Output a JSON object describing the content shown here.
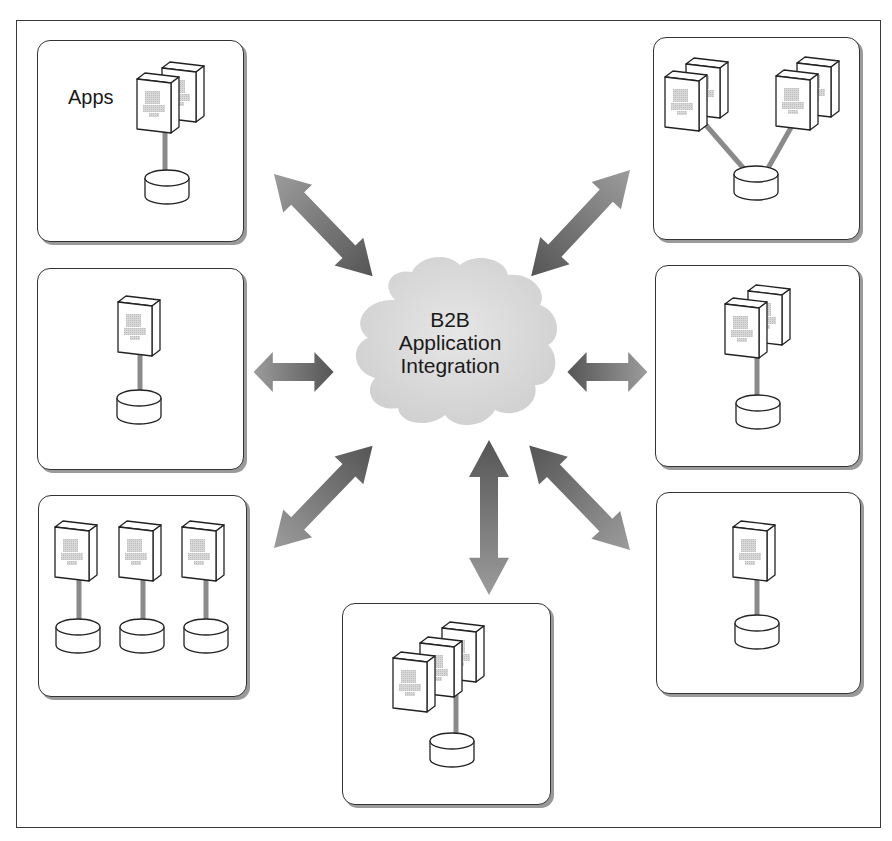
{
  "diagram": {
    "title": "B2B Application Integration",
    "hub": {
      "label_lines": [
        "B2B",
        "Application",
        "Integration"
      ],
      "shape": "cloud",
      "fill": "#d9d9d9"
    },
    "apps_label": "Apps",
    "colors": {
      "box_border": "#333333",
      "box_shadow": "#9a9a9a",
      "arrow_dark": "#555555",
      "arrow_light": "#9a9a9a",
      "connector": "#8a8a8a",
      "cloud_fill": "#d9d9d9"
    },
    "nodes": [
      {
        "id": "top-left",
        "label": "Apps",
        "servers": 2,
        "databases": 1,
        "layout": "stacked"
      },
      {
        "id": "middle-left",
        "servers": 1,
        "databases": 1,
        "layout": "single"
      },
      {
        "id": "bottom-left",
        "servers": 3,
        "databases": 3,
        "layout": "three-pairs"
      },
      {
        "id": "bottom-center",
        "servers": 3,
        "databases": 1,
        "layout": "stacked"
      },
      {
        "id": "top-right",
        "servers": 4,
        "databases": 1,
        "layout": "two-stacks-shared-db"
      },
      {
        "id": "middle-right",
        "servers": 2,
        "databases": 1,
        "layout": "stacked"
      },
      {
        "id": "bottom-right",
        "servers": 1,
        "databases": 1,
        "layout": "single"
      }
    ],
    "connections": [
      {
        "from": "top-left",
        "to": "hub",
        "type": "bidirectional-arrow"
      },
      {
        "from": "middle-left",
        "to": "hub",
        "type": "bidirectional-arrow"
      },
      {
        "from": "bottom-left",
        "to": "hub",
        "type": "bidirectional-arrow"
      },
      {
        "from": "bottom-center",
        "to": "hub",
        "type": "bidirectional-arrow"
      },
      {
        "from": "top-right",
        "to": "hub",
        "type": "bidirectional-arrow"
      },
      {
        "from": "middle-right",
        "to": "hub",
        "type": "bidirectional-arrow"
      },
      {
        "from": "bottom-right",
        "to": "hub",
        "type": "bidirectional-arrow"
      }
    ]
  }
}
